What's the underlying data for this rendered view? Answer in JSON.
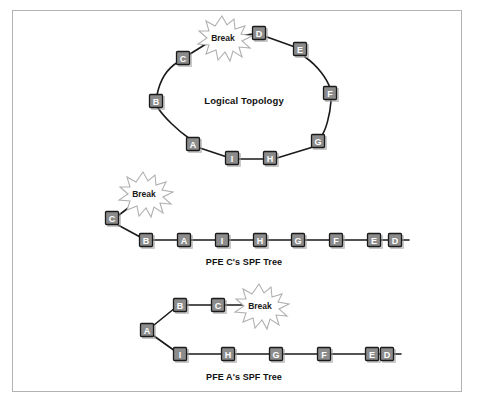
{
  "figure": {
    "frame_color": "#b3b3b3",
    "node_fill": "#8c8c8c",
    "node_stroke": "#1a1a1a",
    "label_color": "#ffffff",
    "line_color": "#1a1a1a"
  },
  "diagram": {
    "type": "network-topology",
    "panels": [
      {
        "id": "logical-topology",
        "title": "Logical Topology",
        "shape": "ring",
        "nodes": [
          {
            "label": "C",
            "x": 184,
            "y": 59
          },
          {
            "label": "D",
            "x": 260,
            "y": 34
          },
          {
            "label": "E",
            "x": 301,
            "y": 50
          },
          {
            "label": "F",
            "x": 331,
            "y": 94
          },
          {
            "label": "G",
            "x": 319,
            "y": 142
          },
          {
            "label": "H",
            "x": 271,
            "y": 160
          },
          {
            "label": "I",
            "x": 233,
            "y": 158
          },
          {
            "label": "A",
            "x": 194,
            "y": 145
          },
          {
            "label": "B",
            "x": 157,
            "y": 102
          }
        ],
        "break": {
          "label": "Break",
          "x": 222,
          "y": 38
        },
        "edges": [
          [
            "B",
            "C"
          ],
          [
            "C",
            "break"
          ],
          [
            "break",
            "D"
          ],
          [
            "D",
            "E"
          ],
          [
            "E",
            "F"
          ],
          [
            "F",
            "G"
          ],
          [
            "G",
            "H"
          ],
          [
            "H",
            "I"
          ],
          [
            "I",
            "A"
          ],
          [
            "A",
            "B"
          ]
        ]
      },
      {
        "id": "pfe-c-spf-tree",
        "title": "PFE C's SPF Tree",
        "shape": "tree",
        "root": "C",
        "nodes": [
          {
            "label": "C",
            "x": 113,
            "y": 218
          },
          {
            "label": "B",
            "x": 147,
            "y": 240
          },
          {
            "label": "A",
            "x": 185,
            "y": 240
          },
          {
            "label": "I",
            "x": 223,
            "y": 240
          },
          {
            "label": "H",
            "x": 261,
            "y": 240
          },
          {
            "label": "G",
            "x": 299,
            "y": 240
          },
          {
            "label": "F",
            "x": 337,
            "y": 240
          },
          {
            "label": "E",
            "x": 375,
            "y": 240
          },
          {
            "label": "D",
            "x": 383,
            "y": 240
          }
        ],
        "break": {
          "label": "Break",
          "x": 143,
          "y": 193
        },
        "caption": "PFE C's SPF Tree"
      },
      {
        "id": "pfe-a-spf-tree",
        "title": "PFE A's SPF Tree",
        "shape": "tree",
        "root": "A",
        "upper_branch": [
          "B",
          "C"
        ],
        "lower_branch": [
          "I",
          "H",
          "G",
          "F",
          "E",
          "D"
        ],
        "break": {
          "label": "Break",
          "x": 259,
          "y": 305
        },
        "caption": "PFE A's SPF Tree"
      }
    ],
    "labels": {
      "break": "Break",
      "logical_topology": "Logical Topology",
      "pfe_c_caption": "PFE C's SPF Tree",
      "pfe_a_caption": "PFE A's SPF Tree"
    },
    "node_labels": {
      "ring": [
        "C",
        "D",
        "E",
        "F",
        "G",
        "H",
        "I",
        "A",
        "B"
      ],
      "tree_c": [
        "C",
        "B",
        "A",
        "I",
        "H",
        "G",
        "F",
        "E",
        "D"
      ],
      "tree_a_upper": [
        "B",
        "C"
      ],
      "tree_a_lower": [
        "I",
        "H",
        "G",
        "F",
        "E",
        "D"
      ],
      "tree_a_root": "A"
    }
  }
}
